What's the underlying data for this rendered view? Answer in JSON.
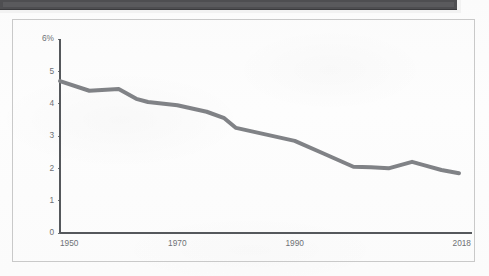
{
  "photo_strip": {
    "name": "cropped-photo-bottom-edge",
    "band_color": "#4e4e51",
    "inner_color": "#5a5a5d"
  },
  "panel": {
    "border_color": "#c9c9c9",
    "background_color": "#fbfbfb"
  },
  "chart_data": {
    "type": "line",
    "title": "",
    "subtitle": "",
    "xlabel": "",
    "ylabel": "",
    "xlim": [
      1950,
      2018
    ],
    "ylim": [
      0,
      6
    ],
    "grid": false,
    "legend": false,
    "legend_position": "none",
    "line_color": "#808286",
    "line_width": 4,
    "axis_color": "#55585c",
    "tick_label_color": "#6e7175",
    "y_ticks": [
      0,
      1,
      2,
      3,
      4,
      5,
      6
    ],
    "y_tick_labels": [
      "0",
      "1",
      "2",
      "3",
      "4",
      "5",
      "6%"
    ],
    "x_ticks": [
      1950,
      1970,
      1990,
      2018
    ],
    "x_tick_labels": [
      "1950",
      "1970",
      "1990",
      "2018"
    ],
    "series": [
      {
        "name": "rate",
        "x": [
          1950,
          1955,
          1960,
          1963,
          1965,
          1970,
          1975,
          1978,
          1980,
          1985,
          1990,
          1995,
          2000,
          2003,
          2006,
          2010,
          2012,
          2015,
          2018
        ],
        "values": [
          4.7,
          4.4,
          4.45,
          4.15,
          4.05,
          3.95,
          3.75,
          3.55,
          3.25,
          3.05,
          2.85,
          2.45,
          2.05,
          2.03,
          2.0,
          2.2,
          2.1,
          1.95,
          1.85
        ]
      }
    ]
  }
}
